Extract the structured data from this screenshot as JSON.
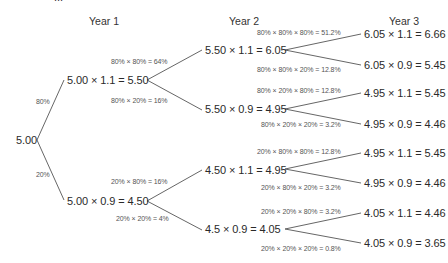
{
  "top_fragment": "...",
  "headers": {
    "year1": "Year 1",
    "year2": "Year 2",
    "year3": "Year 3"
  },
  "root": {
    "value": "5.00"
  },
  "year1": {
    "up": {
      "label": "5.00 × 1.1 = 5.50",
      "edge_prob": "80%"
    },
    "down": {
      "label": "5.00 × 0.9 = 4.50",
      "edge_prob": "20%"
    }
  },
  "year2": {
    "uu": {
      "label": "5.50 × 1.1 = 6.05",
      "edge_prob": "80% × 80% = 64%"
    },
    "ud": {
      "label": "5.50 × 0.9 = 4.95",
      "edge_prob": "80% × 20% = 16%"
    },
    "du": {
      "label": "4.50 × 1.1 = 4.95",
      "edge_prob": "20% × 80% = 16%"
    },
    "dd": {
      "label": "4.5 × 0.9 = 4.05",
      "edge_prob": "20% × 20% = 4%"
    }
  },
  "year3": {
    "uuu": {
      "label": "6.05 × 1.1 = 6.66",
      "edge_prob": "80% × 80% × 80% = 51.2%"
    },
    "uud": {
      "label": "6.05 × 0.9 = 5.45",
      "edge_prob": "80% × 80% × 20% = 12.8%"
    },
    "udu": {
      "label": "4.95 × 1.1 = 5.45",
      "edge_prob": "80% × 20% × 80% = 12.8%"
    },
    "udd": {
      "label": "4.95 × 0.9 = 4.46",
      "edge_prob": "80% × 20% × 20% = 3.2%"
    },
    "duu": {
      "label": "4.95 × 1.1 = 5.45",
      "edge_prob": "20% × 80% × 80% = 12.8%"
    },
    "dud": {
      "label": "4.95 × 0.9 = 4.46",
      "edge_prob": "20% × 80% × 20% = 3.2%"
    },
    "ddu": {
      "label": "4.05 × 1.1 = 4.46",
      "edge_prob": "20% × 20% × 80% = 3.2%"
    },
    "ddd": {
      "label": "4.05 × 0.9 = 3.65",
      "edge_prob": "20% × 20% × 20% = 0.8%"
    }
  },
  "colors": {
    "line": "#555555",
    "text": "#2a2a2a",
    "prob_text": "#555555"
  }
}
